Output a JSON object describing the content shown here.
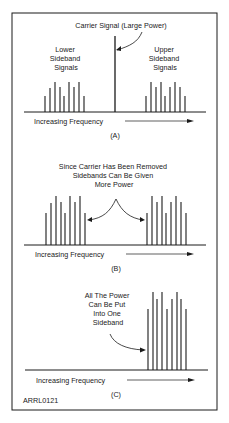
{
  "figure_id": "ARRL0121",
  "frame": {
    "x": 12,
    "y": 13,
    "w": 205,
    "h": 397
  },
  "colors": {
    "ink": "#1a1a1a",
    "background": "#ffffff"
  },
  "panels": [
    {
      "id": "A",
      "caption": "(A)",
      "baseline_y": 112,
      "axis_label": "Increasing Frequency",
      "annotations": {
        "carrier": "Carrier Signal (Large Power)",
        "lower": [
          "Lower",
          "Sideband",
          "Signals"
        ],
        "upper": [
          "Upper",
          "Sideband",
          "Signals"
        ]
      },
      "lower_bars": {
        "x": [
          45,
          50,
          55,
          60,
          64,
          69,
          74,
          79,
          84
        ],
        "h": [
          16,
          24,
          30,
          25,
          16,
          30,
          25,
          30,
          16
        ]
      },
      "carrier_bar": {
        "x": 115,
        "h": 76
      },
      "upper_bars": {
        "x": [
          146,
          151,
          156,
          161,
          165,
          170,
          175,
          180,
          185
        ],
        "h": [
          16,
          30,
          25,
          30,
          16,
          25,
          30,
          25,
          16
        ]
      }
    },
    {
      "id": "B",
      "caption": "(B)",
      "baseline_y": 245,
      "axis_label": "Increasing Frequency",
      "annotations": {
        "center": [
          "Since Carrier Has Been Removed",
          "Sidebands Can Be Given",
          "More Power"
        ]
      },
      "lower_bars": {
        "x": [
          46,
          51,
          56,
          61,
          65,
          70,
          75,
          80,
          85
        ],
        "h": [
          32,
          42,
          49,
          43,
          32,
          49,
          43,
          49,
          32
        ]
      },
      "upper_bars": {
        "x": [
          147,
          152,
          157,
          162,
          166,
          171,
          176,
          181,
          186
        ],
        "h": [
          32,
          49,
          43,
          49,
          32,
          43,
          49,
          43,
          32
        ]
      }
    },
    {
      "id": "C",
      "caption": "(C)",
      "baseline_y": 370,
      "axis_label": "Increasing Frequency",
      "annotations": {
        "center": [
          "All The Power",
          "Can Be Put",
          "Into One",
          "Sideband"
        ]
      },
      "upper_bars": {
        "x": [
          148,
          153,
          157,
          162,
          167,
          172,
          177,
          181,
          186
        ],
        "h": [
          61,
          78,
          71,
          78,
          61,
          71,
          78,
          71,
          61
        ]
      }
    }
  ]
}
